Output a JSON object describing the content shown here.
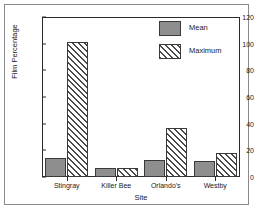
{
  "chart_data": {
    "type": "bar",
    "title": "",
    "xlabel": "Site",
    "ylabel": "Film Percentage",
    "categories": [
      "Stingray",
      "Killer Bee",
      "Orlando's",
      "Westby"
    ],
    "series": [
      {
        "name": "Mean",
        "values": [
          14,
          7,
          13,
          12
        ],
        "color": "#8e8e8e",
        "fill": "solid"
      },
      {
        "name": "Maximum",
        "values": [
          101,
          7,
          37,
          18
        ],
        "color": "#4a4a4a",
        "fill": "diagonal-hatch"
      }
    ],
    "ylim": [
      0,
      120
    ],
    "yticks": [
      0,
      20,
      40,
      60,
      80,
      100,
      120
    ],
    "grid": false,
    "legend_position": "top-right",
    "frame": "box"
  },
  "axes": {
    "y_tick_labels": [
      "0",
      "20",
      "40",
      "60",
      "80",
      "100",
      "120"
    ],
    "x_tick_labels": [
      "Stingray",
      "Killer Bee",
      "Orlando's",
      "Westby"
    ],
    "y_title": "Film Percentage",
    "x_title": "Site"
  },
  "legend": {
    "items": [
      {
        "label": "Mean"
      },
      {
        "label": "Maximum"
      }
    ]
  },
  "colors": {
    "mean_fill": "#8e8e8e",
    "hatch_line": "#4a4a4a",
    "axis": "#2b2b2b",
    "outer_border": "#8a8a8a",
    "background": "#ffffff"
  }
}
